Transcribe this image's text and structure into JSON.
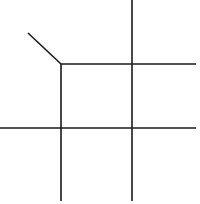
{
  "diagram": {
    "width": 200,
    "height": 204,
    "background": "#ffffff",
    "stroke_color": "#1a1a1a",
    "stroke_width": 1.6,
    "lines": [
      {
        "id": "diagonal-stub",
        "x1": 28,
        "y1": 33,
        "x2": 61,
        "y2": 64
      },
      {
        "id": "vertical-left",
        "x1": 61,
        "y1": 64,
        "x2": 61,
        "y2": 201
      },
      {
        "id": "vertical-right",
        "x1": 132,
        "y1": 0,
        "x2": 132,
        "y2": 201
      },
      {
        "id": "horizontal-top",
        "x1": 61,
        "y1": 64,
        "x2": 196,
        "y2": 64
      },
      {
        "id": "horizontal-bottom",
        "x1": 0,
        "y1": 128,
        "x2": 196,
        "y2": 128
      }
    ]
  }
}
